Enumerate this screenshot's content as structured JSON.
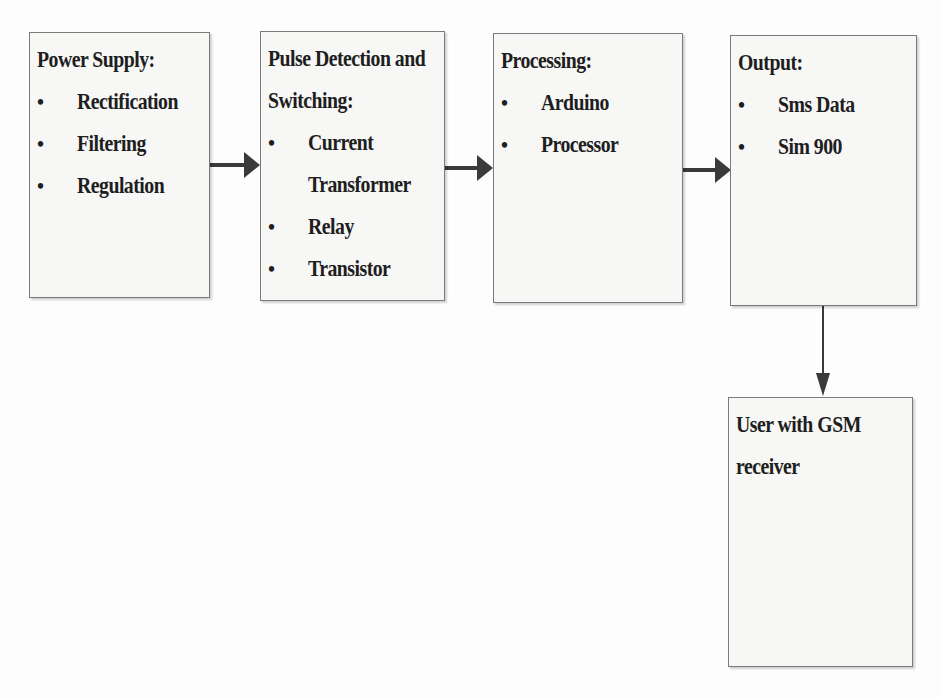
{
  "diagram": {
    "type": "block-diagram",
    "blocks": [
      {
        "id": "power_supply",
        "title": "Power Supply:",
        "items": [
          "Rectification",
          "Filtering",
          "Regulation"
        ]
      },
      {
        "id": "pulse_detection",
        "title": "Pulse Detection and Switching:",
        "title_lines": [
          "Pulse Detection and",
          "Switching:"
        ],
        "items": [
          "Current Transformer",
          "Relay",
          "Transistor"
        ],
        "item_lines": [
          [
            "Current",
            "Transformer"
          ],
          [
            "Relay"
          ],
          [
            "Transistor"
          ]
        ]
      },
      {
        "id": "processing",
        "title": "Processing:",
        "items": [
          "Arduino",
          "Processor"
        ]
      },
      {
        "id": "output",
        "title": "Output:",
        "items": [
          "Sms Data",
          "Sim 900"
        ]
      },
      {
        "id": "user",
        "title": "User with GSM receiver",
        "title_lines": [
          "User with GSM",
          "receiver"
        ],
        "items": []
      }
    ],
    "connections": [
      {
        "from": "power_supply",
        "to": "pulse_detection",
        "direction": "right"
      },
      {
        "from": "pulse_detection",
        "to": "processing",
        "direction": "right"
      },
      {
        "from": "processing",
        "to": "output",
        "direction": "right"
      },
      {
        "from": "output",
        "to": "user",
        "direction": "down"
      }
    ],
    "bullet_glyph": "•",
    "colors": {
      "border": "#7a7a7a",
      "fill": "#f7f7f6",
      "arrow": "#3a3a3a",
      "text": "#1e1e1e"
    }
  }
}
